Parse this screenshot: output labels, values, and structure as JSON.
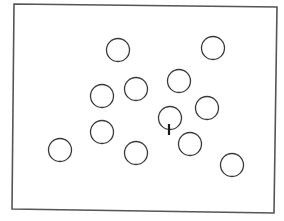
{
  "figure": {
    "width": 284,
    "height": 221,
    "background": "#ffffff",
    "stroke_color": "#3a3a3a",
    "frame": {
      "corners": [
        [
          14,
          4
        ],
        [
          277,
          7
        ],
        [
          274,
          213
        ],
        [
          12,
          209
        ]
      ],
      "stroke_color": "#555555",
      "stroke_width": 1.6
    },
    "circles": [
      {
        "cx": 118,
        "cy": 50,
        "r": 11.5
      },
      {
        "cx": 213,
        "cy": 48,
        "r": 11.5
      },
      {
        "cx": 102,
        "cy": 96,
        "r": 11.5
      },
      {
        "cx": 136,
        "cy": 89,
        "r": 11.5
      },
      {
        "cx": 179,
        "cy": 81,
        "r": 11.5
      },
      {
        "cx": 207,
        "cy": 108,
        "r": 11.5
      },
      {
        "cx": 170,
        "cy": 118,
        "r": 11.5
      },
      {
        "cx": 190,
        "cy": 144,
        "r": 11.5
      },
      {
        "cx": 102,
        "cy": 132,
        "r": 11.5
      },
      {
        "cx": 60,
        "cy": 150,
        "r": 11.5
      },
      {
        "cx": 136,
        "cy": 153,
        "r": 11.5
      },
      {
        "cx": 232,
        "cy": 165,
        "r": 11.5
      }
    ],
    "tick_mark": {
      "x": 169,
      "y1": 124,
      "y2": 135,
      "stroke_width": 2.2,
      "stroke_color": "#1a1a1a"
    }
  }
}
